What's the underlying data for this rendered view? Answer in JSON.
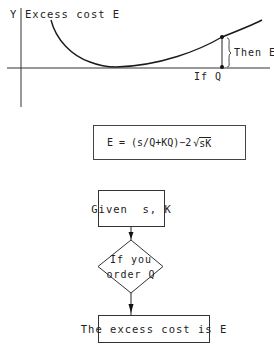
{
  "graph": {
    "y_axis_label": "Y",
    "curve_label": "Excess cost E",
    "x_point_label": "If Q",
    "brace_label": "Then E"
  },
  "formula": {
    "text": "E = (s/Q + KQ) − 2 √sK",
    "lhs": "E = (s/Q+KQ)−2",
    "radicand": "sK"
  },
  "flowchart": {
    "input_box": "Given  s, K",
    "decision_line1": "If you",
    "decision_line2": "order Q",
    "output_box": "The excess cost is E"
  },
  "colors": {
    "ink": "#222222",
    "background": "#ffffff"
  }
}
